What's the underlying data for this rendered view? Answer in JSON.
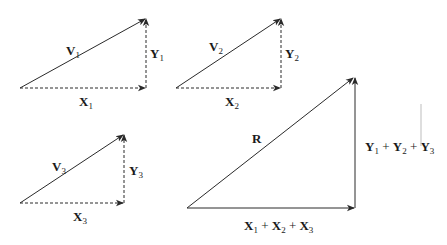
{
  "diagram": {
    "title": "",
    "components": [
      {
        "id": "v1",
        "vector": {
          "symbol": "V",
          "sub": "1"
        },
        "x_component": {
          "symbol": "X",
          "sub": "1"
        },
        "y_component": {
          "symbol": "Y",
          "sub": "1"
        }
      },
      {
        "id": "v2",
        "vector": {
          "symbol": "V",
          "sub": "2"
        },
        "x_component": {
          "symbol": "X",
          "sub": "2"
        },
        "y_component": {
          "symbol": "Y",
          "sub": "2"
        }
      },
      {
        "id": "v3",
        "vector": {
          "symbol": "V",
          "sub": "3"
        },
        "x_component": {
          "symbol": "X",
          "sub": "3"
        },
        "y_component": {
          "symbol": "Y",
          "sub": "3"
        }
      }
    ],
    "resultant": {
      "vector": {
        "symbol": "R"
      },
      "x_sum": {
        "parts": [
          {
            "symbol": "X",
            "sub": "1"
          },
          {
            "symbol": "X",
            "sub": "2"
          },
          {
            "symbol": "X",
            "sub": "3"
          }
        ],
        "operator": "+"
      },
      "y_sum": {
        "parts": [
          {
            "symbol": "Y",
            "sub": "1"
          },
          {
            "symbol": "Y",
            "sub": "2"
          },
          {
            "symbol": "Y",
            "sub": "3"
          }
        ],
        "operator": "+"
      }
    },
    "colors": {
      "line": "#2a2a2a",
      "text": "#1a1a1a",
      "background": "#ffffff"
    }
  }
}
